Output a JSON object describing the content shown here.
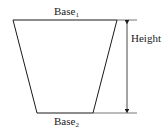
{
  "diagram": {
    "type": "trapezoid-dimension",
    "labels": {
      "top_base": "Base",
      "top_base_sub": "1",
      "bottom_base": "Base",
      "bottom_base_sub": "2",
      "height": "Height"
    },
    "colors": {
      "stroke": "#1a1a1a",
      "background": "#ffffff"
    }
  }
}
